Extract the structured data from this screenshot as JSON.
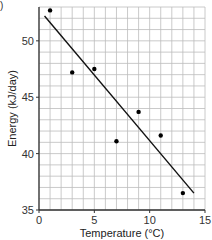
{
  "corner_mark": ")",
  "chart_data": {
    "type": "scatter",
    "title": "",
    "xlabel": "Temperature (°C)",
    "ylabel": "Energy (kJ/day)",
    "xlim": [
      0,
      15
    ],
    "ylim": [
      35,
      53
    ],
    "x_ticks": [
      0,
      5,
      10,
      15
    ],
    "y_ticks": [
      35,
      40,
      45,
      50
    ],
    "grid": true,
    "grid_step_x": 1,
    "grid_step_y": 1,
    "series": [
      {
        "name": "measurements",
        "x": [
          1,
          3,
          5,
          7,
          9,
          11,
          13
        ],
        "y": [
          52.7,
          47.2,
          47.5,
          41.1,
          43.7,
          41.6,
          36.5
        ]
      }
    ],
    "trendline": {
      "x": [
        0.5,
        14
      ],
      "y": [
        52.2,
        36.5
      ]
    },
    "legend": null
  },
  "plot": {
    "left": 39,
    "right": 205,
    "top": 7,
    "bottom": 210,
    "colors": {
      "grid": "#bdbdbd",
      "axis": "#333333",
      "point": "#000000",
      "line": "#111111"
    }
  }
}
